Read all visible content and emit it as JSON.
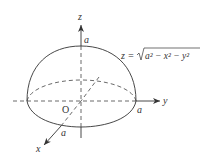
{
  "diagram": {
    "type": "upper hemisphere in 3D coordinates",
    "axes": {
      "x_label": "x",
      "y_label": "y",
      "z_label": "z"
    },
    "origin_label": "O",
    "radius_labels": {
      "z_intercept": "a",
      "y_intercept": "a",
      "x_intercept": "a"
    },
    "equation": {
      "lhs": "z =",
      "radicand": "a² − x² − y²"
    },
    "colors": {
      "stroke": "#333333",
      "background": "#ffffff"
    }
  }
}
